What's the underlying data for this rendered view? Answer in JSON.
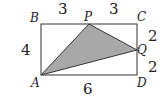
{
  "diagram": {
    "type": "geometry",
    "shape": "rectangle",
    "vertices": {
      "A": {
        "label": "A",
        "x": 41,
        "y": 75
      },
      "B": {
        "label": "B",
        "x": 41,
        "y": 24
      },
      "C": {
        "label": "C",
        "x": 137,
        "y": 24
      },
      "D": {
        "label": "D",
        "x": 137,
        "y": 75
      },
      "P": {
        "label": "P",
        "x": 89,
        "y": 24
      },
      "Q": {
        "label": "Q",
        "x": 137,
        "y": 50
      }
    },
    "shaded_triangle": [
      "A",
      "P",
      "Q"
    ],
    "colors": {
      "stroke": "#333333",
      "fill": "#a8a8a8",
      "text": "#222222"
    },
    "lengths": {
      "BP": "3",
      "PC": "3",
      "AB": "4",
      "CQ": "2",
      "QD": "2",
      "AD": "6"
    }
  }
}
